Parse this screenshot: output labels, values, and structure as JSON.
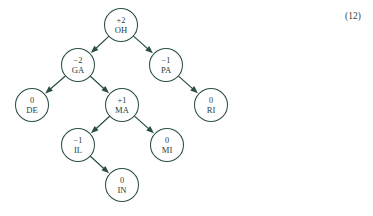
{
  "figure": {
    "equation_number": "(12)",
    "stroke_color": "#2c4f45",
    "text_color": "#263f38",
    "background_color": "#ffffff",
    "node_radius": 16.5
  },
  "nodes": [
    {
      "id": "OH",
      "label": "OH",
      "value": "+2",
      "cx": 121,
      "cy": 25
    },
    {
      "id": "GA",
      "label": "GA",
      "value": "−2",
      "cx": 78,
      "cy": 65
    },
    {
      "id": "PA",
      "label": "PA",
      "value": "−1",
      "cx": 166,
      "cy": 65
    },
    {
      "id": "DE",
      "label": "DE",
      "value": "0",
      "cx": 32,
      "cy": 105
    },
    {
      "id": "MA",
      "label": "MA",
      "value": "+1",
      "cx": 122,
      "cy": 105
    },
    {
      "id": "RI",
      "label": "RI",
      "value": "0",
      "cx": 211,
      "cy": 105
    },
    {
      "id": "IL",
      "label": "IL",
      "value": "−1",
      "cx": 78,
      "cy": 145
    },
    {
      "id": "MI",
      "label": "MI",
      "value": "0",
      "cx": 167,
      "cy": 145
    },
    {
      "id": "IN",
      "label": "IN",
      "value": "0",
      "cx": 122,
      "cy": 185
    }
  ],
  "edges": [
    {
      "from": "OH",
      "to": "GA"
    },
    {
      "from": "OH",
      "to": "PA"
    },
    {
      "from": "GA",
      "to": "DE"
    },
    {
      "from": "GA",
      "to": "MA"
    },
    {
      "from": "PA",
      "to": "RI"
    },
    {
      "from": "MA",
      "to": "IL"
    },
    {
      "from": "MA",
      "to": "MI"
    },
    {
      "from": "IL",
      "to": "IN"
    }
  ]
}
